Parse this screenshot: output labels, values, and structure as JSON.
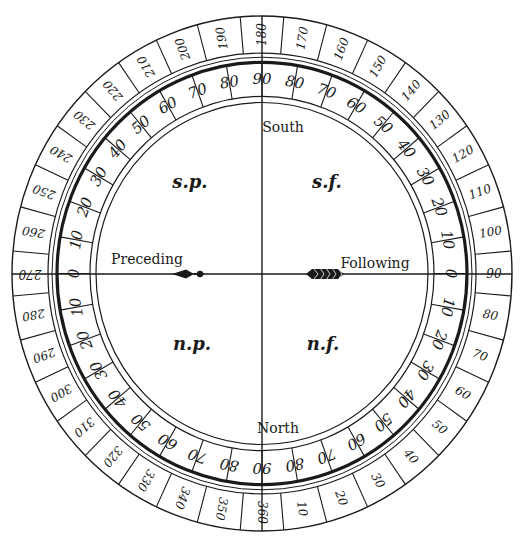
{
  "diagram": {
    "type": "position-angle dial",
    "colors": {
      "ink": "#1a1a1a",
      "paper": "#ffffff"
    },
    "directions": {
      "top": "South",
      "bottom": "North",
      "left": "Preceding",
      "right": "Following"
    },
    "quadrants": {
      "top_left": "s.p.",
      "top_right": "s.f.",
      "bottom_left": "n.p.",
      "bottom_right": "n.f."
    },
    "outer_scale": {
      "description": "Position angle 0–360, 360 at North (bottom), 90 at Following (right), 180 at South (top), 270 at Preceding (left)",
      "labels": [
        "10",
        "20",
        "30",
        "40",
        "50",
        "60",
        "70",
        "80",
        "90",
        "100",
        "110",
        "120",
        "130",
        "140",
        "150",
        "160",
        "170",
        "180",
        "190",
        "200",
        "210",
        "220",
        "230",
        "240",
        "250",
        "260",
        "270",
        "280",
        "290",
        "300",
        "310",
        "320",
        "330",
        "340",
        "350",
        "360"
      ]
    },
    "inner_scale": {
      "description": "Angle from the parallel, 0 at Preceding/Following, 90 at South/North, in each quadrant",
      "labels": [
        "0",
        "10",
        "20",
        "30",
        "40",
        "50",
        "60",
        "70",
        "80",
        "90"
      ]
    },
    "pointers": {
      "left": "arrowhead-pointer",
      "right": "feathered-tail"
    }
  }
}
